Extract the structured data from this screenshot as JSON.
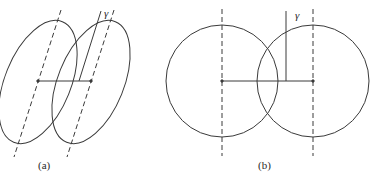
{
  "panels": [
    {
      "id": "a",
      "caption": "(a)",
      "angle_label": "γ",
      "shape": "tilted ellipses"
    },
    {
      "id": "b",
      "caption": "(b)",
      "angle_label": "γ",
      "shape": "circles"
    }
  ],
  "colors": {
    "stroke": "#3a3a3a",
    "background": "#ffffff"
  }
}
